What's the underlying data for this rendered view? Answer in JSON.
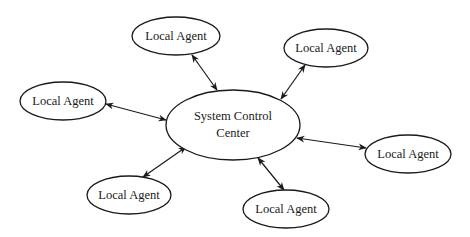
{
  "diagram": {
    "type": "hub-and-spoke",
    "center": {
      "label_line1": "System Control",
      "label_line2": "Center",
      "cx": 233,
      "cy": 125,
      "rx": 67,
      "ry": 35
    },
    "agents": [
      {
        "label": "Local Agent",
        "cx": 176,
        "cy": 36,
        "rx": 44,
        "ry": 19
      },
      {
        "label": "Local Agent",
        "cx": 326,
        "cy": 48,
        "rx": 42,
        "ry": 19
      },
      {
        "label": "Local Agent",
        "cx": 63,
        "cy": 101,
        "rx": 43,
        "ry": 19
      },
      {
        "label": "Local Agent",
        "cx": 408,
        "cy": 154,
        "rx": 43,
        "ry": 19
      },
      {
        "label": "Local Agent",
        "cx": 129,
        "cy": 195,
        "rx": 42,
        "ry": 19
      },
      {
        "label": "Local Agent",
        "cx": 286,
        "cy": 209,
        "rx": 43,
        "ry": 19
      }
    ],
    "edges": [
      {
        "x1": 192,
        "y1": 55,
        "x2": 217,
        "y2": 90
      },
      {
        "x1": 305,
        "y1": 65,
        "x2": 281,
        "y2": 99
      },
      {
        "x1": 106,
        "y1": 104,
        "x2": 166,
        "y2": 120
      },
      {
        "x1": 366,
        "y1": 148,
        "x2": 297,
        "y2": 138
      },
      {
        "x1": 143,
        "y1": 177,
        "x2": 186,
        "y2": 147
      },
      {
        "x1": 284,
        "y1": 190,
        "x2": 258,
        "y2": 158
      }
    ],
    "edge_style": "bidirectional-arrow",
    "colors": {
      "stroke": "#1a1a1a",
      "fill": "#ffffff"
    }
  }
}
